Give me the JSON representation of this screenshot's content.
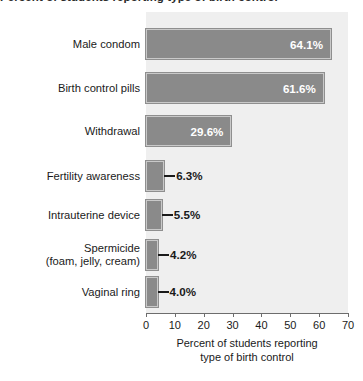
{
  "chart_data": {
    "type": "bar",
    "orientation": "horizontal",
    "title": "Percent of students reporting type of birth control",
    "subtitle": "",
    "xlabel": "Percent of students reporting type of birth control",
    "ylabel": "",
    "xlim": [
      0,
      70
    ],
    "xticks": [
      0,
      10,
      20,
      30,
      40,
      50,
      60,
      70
    ],
    "grid": false,
    "legend": null,
    "categories": [
      "Male condom",
      "Birth control pills",
      "Withdrawal",
      "Fertility awareness",
      "Intrauterine device",
      "Spermicide\n(foam, jelly, cream)",
      "Vaginal ring"
    ],
    "values": [
      64.1,
      61.6,
      29.6,
      6.3,
      5.5,
      4.2,
      4.0
    ],
    "value_labels": [
      "64.1%",
      "61.6%",
      "29.6%",
      "6.3%",
      "5.5%",
      "4.2%",
      "4.0%"
    ],
    "label_placement": [
      "inside",
      "inside",
      "inside",
      "outside",
      "outside",
      "outside",
      "outside"
    ],
    "colors": {
      "bar_fill": "#8a8a8a",
      "bar_inner_border": "#c9c9c9",
      "bar_outer_border": "#8f8f8f",
      "plot_background": "#efefef",
      "page_background": "#ffffff",
      "axis": "#6d6d6d",
      "text": "#1a1a1a",
      "inside_label_text": "#ffffff"
    }
  },
  "caption": {
    "line1": "Percent of students reporting",
    "line2": "type of birth control"
  },
  "axis": {
    "tick_labels": [
      "0",
      "10",
      "20",
      "30",
      "40",
      "50",
      "60",
      "70"
    ]
  }
}
